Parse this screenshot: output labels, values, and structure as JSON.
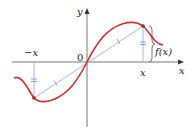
{
  "diagram": {
    "title": "",
    "labels": {
      "y_axis": "y",
      "x_axis": "x",
      "origin": "0",
      "neg_x": "−x",
      "pos_x": "x",
      "fx": "f(x)"
    },
    "colors": {
      "curve": "#d0312d",
      "axes": "#333333",
      "secant": "#8fa8d0",
      "points": "#b0201c",
      "tick_marks": "#6a8fc8"
    },
    "elements": {
      "curve": "odd function curve through origin",
      "secant": "line segment from (-x, -f(x)) to (x, f(x)) through origin",
      "brace": "right brace marking height f(x)"
    }
  }
}
